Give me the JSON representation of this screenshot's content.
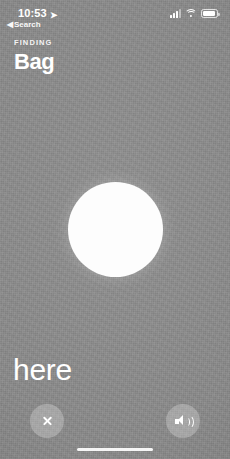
{
  "status_bar": {
    "time": "10:53",
    "location_arrow_icon": "location-arrow-icon",
    "cellular_icon": "cellular-signal-icon",
    "wifi_icon": "wifi-icon",
    "battery_icon": "battery-icon"
  },
  "back_link": {
    "caret": "◀",
    "label": "Search"
  },
  "header": {
    "eyebrow": "FINDING",
    "title": "Bag"
  },
  "proximity": {
    "indicator_name": "proximity-circle",
    "distance_label": "here"
  },
  "controls": {
    "close_icon": "close-x-icon",
    "sound_icon": "speaker-wave-icon"
  },
  "colors": {
    "background_gray": "#8b8b8b",
    "circle_white": "#fdfdfd",
    "text_white": "#ffffff",
    "control_fill": "rgba(235,235,235,0.30)"
  }
}
